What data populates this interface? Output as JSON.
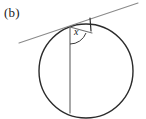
{
  "figure": {
    "part_label": "(b)",
    "angle_label": "x",
    "colors": {
      "background": "#ffffff",
      "circle_stroke": "#2b2b2b",
      "tangent_stroke": "#8a8a8a",
      "chord_stroke": "#6e6e6e",
      "arc_stroke": "#3a3a3a",
      "tick_stroke": "#2b2b2b",
      "text": "#1a1a1a"
    },
    "circle": {
      "name": "circle",
      "center_x": 86,
      "center_y": 71,
      "radius": 47,
      "stroke_width": 1.4
    },
    "tangent_line": {
      "name": "tangent-line",
      "x1": 19,
      "y1": 43,
      "x2": 138,
      "y2": 3,
      "stroke_width": 1.1
    },
    "tangent_point": {
      "name": "tangent-point",
      "x": 70,
      "y": 26
    },
    "vertical_chord": {
      "name": "vertical-chord",
      "x1": 70,
      "y1": 27,
      "x2": 70,
      "y2": 113,
      "stroke_width": 1.2
    },
    "second_chord": {
      "name": "second-chord",
      "x1": 70,
      "y1": 27,
      "x2": 92,
      "y2": 33,
      "stroke_width": 1.1
    },
    "tick_mark": {
      "name": "tick-mark",
      "x1": 90,
      "y1": 18,
      "x2": 91,
      "y2": 31,
      "stroke_width": 1.2
    },
    "angle_arc": {
      "name": "angle-arc",
      "path": "M 70 44 A 17 17 0 0 0 86 33",
      "stroke_width": 1.0
    }
  }
}
